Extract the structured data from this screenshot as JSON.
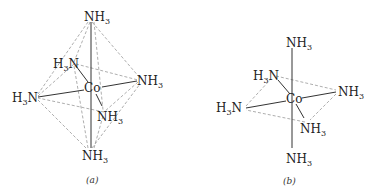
{
  "diagrams": [
    {
      "id": "a",
      "caption": "(a)",
      "center": {
        "label": "Co"
      },
      "ligands": [
        {
          "position": "top",
          "main": "NH",
          "sub": "3"
        },
        {
          "position": "upper-left",
          "pre": "H",
          "sub": "3",
          "main": "N"
        },
        {
          "position": "right",
          "main": "NH",
          "sub": "3"
        },
        {
          "position": "left",
          "pre": "H",
          "sub": "3",
          "main": "N"
        },
        {
          "position": "lower-right",
          "main": "NH",
          "sub": "3"
        },
        {
          "position": "bottom",
          "main": "NH",
          "sub": "3"
        }
      ],
      "style": "octahedron with dashed edges"
    },
    {
      "id": "b",
      "caption": "(b)",
      "center": {
        "label": "Co"
      },
      "ligands": [
        {
          "position": "top",
          "main": "NH",
          "sub": "3"
        },
        {
          "position": "upper-left",
          "pre": "H",
          "sub": "3",
          "main": "N"
        },
        {
          "position": "right",
          "main": "NH",
          "sub": "3"
        },
        {
          "position": "left",
          "pre": "H",
          "sub": "3",
          "main": "N"
        },
        {
          "position": "lower-right",
          "main": "NH",
          "sub": "3"
        },
        {
          "position": "bottom",
          "main": "NH",
          "sub": "3"
        }
      ],
      "style": "equatorial plane dashed, axial bonds solid"
    }
  ]
}
